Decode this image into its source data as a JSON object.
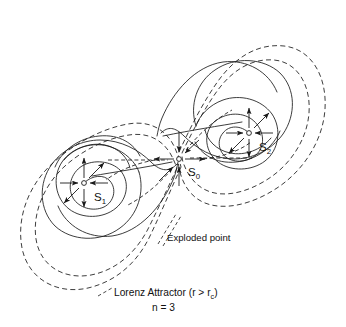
{
  "figure": {
    "caption_line1_prefix": "Lorenz Attractor  (r > r",
    "caption_line1_sub": "c",
    "caption_line1_suffix": ")",
    "caption_line2": "n = 3",
    "annotation_exploded": "Exploded point",
    "colors": {
      "ink": "#1a1a1a",
      "background": "#ffffff",
      "text": "#111111"
    },
    "fixed_points": [
      {
        "id": "S0",
        "label_base": "S",
        "label_sub": "0",
        "x": 179,
        "y": 159,
        "type": "saddle",
        "description": "Exploded point at origin; unstable horizontally, stable vertically"
      },
      {
        "id": "S1",
        "label_base": "S",
        "label_sub": "1",
        "x": 84,
        "y": 183,
        "type": "spiral-source",
        "description": "Left lobe unstable focus"
      },
      {
        "id": "S2",
        "label_base": "S",
        "label_sub": "2",
        "x": 249,
        "y": 133,
        "type": "spiral-source",
        "description": "Right lobe unstable focus"
      }
    ],
    "line_styles": {
      "trajectory": "solid",
      "basin_boundary": "dashed",
      "separatrix": "dashed"
    },
    "structure": {
      "lobes": 2,
      "dashed_contours_per_lobe": 2,
      "spiral_turns_per_lobe": 3
    }
  }
}
